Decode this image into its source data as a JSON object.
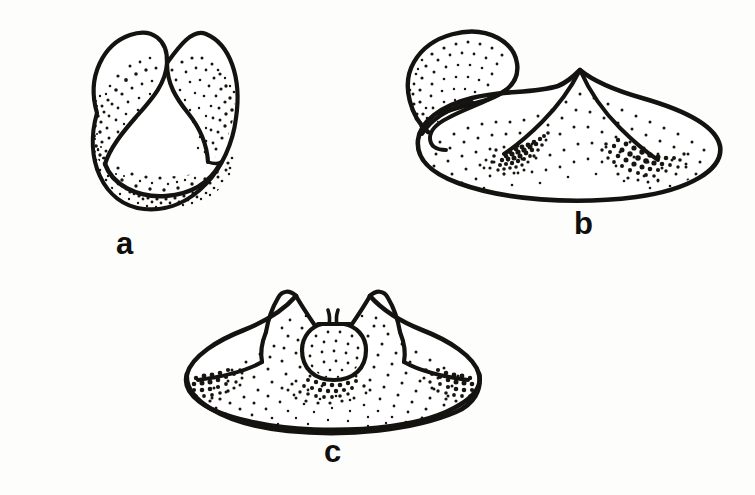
{
  "page": {
    "width": 755,
    "height": 495,
    "background_color": "#fdfdfc",
    "ink_color": "#141310",
    "stipple_color": "#17150f"
  },
  "figures": [
    {
      "id": "a",
      "label": "a",
      "label_x": 116,
      "label_y": 228,
      "view": "anterior view, horseshoe-shaped with two dorsal lobes curving inward and a ventral crescent band",
      "bbox": {
        "x": 48,
        "y": 25,
        "width": 197,
        "height": 190
      },
      "stipple_regions": [
        {
          "name": "left-lobe-shading",
          "density": "medium"
        },
        {
          "name": "right-lobe-shading",
          "density": "medium"
        },
        {
          "name": "ventral-crescent-shading",
          "density": "heavy"
        }
      ]
    },
    {
      "id": "b",
      "label": "b",
      "label_x": 578,
      "label_y": 214,
      "view": "oblique lateral view, broad dome with overhanging curled upper lobe and two dark paired depressions",
      "bbox": {
        "x": 400,
        "y": 30,
        "width": 315,
        "height": 175
      },
      "stipple_regions": [
        {
          "name": "upper-lobe-shading",
          "density": "medium"
        },
        {
          "name": "dome-body-shading",
          "density": "medium"
        },
        {
          "name": "left-pit-concentration",
          "density": "dense-smudge"
        },
        {
          "name": "right-pit-concentration",
          "density": "dense-smudge"
        }
      ]
    },
    {
      "id": "c",
      "label": "c",
      "label_x": 333,
      "label_y": 449,
      "view": "anterior-dorsal view, wide shield-shaped dome with two raised horns flanking a central rounded bulb",
      "bbox": {
        "x": 185,
        "y": 285,
        "width": 290,
        "height": 145
      },
      "stipple_regions": [
        {
          "name": "dome-body-shading",
          "density": "medium"
        },
        {
          "name": "central-bulb-shading",
          "density": "light"
        },
        {
          "name": "left-edge-concentration",
          "density": "dense-smudge"
        },
        {
          "name": "right-edge-concentration",
          "density": "dense-smudge"
        },
        {
          "name": "sub-bulb-concentration",
          "density": "dense-smudge"
        }
      ]
    }
  ]
}
